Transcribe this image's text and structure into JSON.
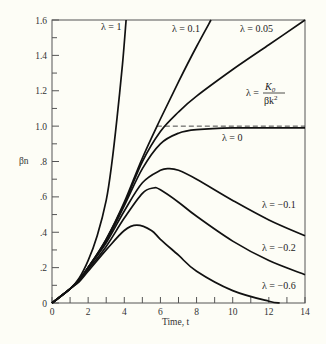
{
  "chart_data": {
    "type": "line",
    "title": "",
    "xlabel": "Time, t",
    "ylabel": "βn",
    "xlim": [
      0,
      14
    ],
    "ylim": [
      0,
      1.6
    ],
    "grid": false,
    "x_ticks": [
      "0",
      "2",
      "4",
      "6",
      "8",
      "10",
      "12",
      "14"
    ],
    "y_ticks": [
      "0",
      ".2",
      ".4",
      ".6",
      ".8",
      "1.0",
      "1.2",
      "1.4",
      "1.6"
    ],
    "reference_line": {
      "y": 1.0,
      "style": "dashed",
      "label": "λ = K₀/βk²"
    },
    "series": [
      {
        "name": "λ = 1",
        "label": "λ = 1",
        "points": [
          [
            0,
            0
          ],
          [
            1,
            0.08
          ],
          [
            1.5,
            0.14
          ],
          [
            2,
            0.24
          ],
          [
            2.5,
            0.38
          ],
          [
            3,
            0.58
          ],
          [
            3.3,
            0.78
          ],
          [
            3.6,
            1.05
          ],
          [
            3.9,
            1.35
          ],
          [
            4.1,
            1.6
          ]
        ]
      },
      {
        "name": "λ = 0.1",
        "label": "λ = 0.1",
        "points": [
          [
            0,
            0
          ],
          [
            1,
            0.08
          ],
          [
            1.5,
            0.13
          ],
          [
            2,
            0.2
          ],
          [
            3,
            0.36
          ],
          [
            4,
            0.57
          ],
          [
            5,
            0.82
          ],
          [
            6,
            1.04
          ],
          [
            7,
            1.25
          ],
          [
            8,
            1.45
          ],
          [
            8.8,
            1.6
          ]
        ]
      },
      {
        "name": "λ = 0.05",
        "label": "λ = 0.05",
        "points": [
          [
            0,
            0
          ],
          [
            1,
            0.08
          ],
          [
            1.5,
            0.13
          ],
          [
            2,
            0.2
          ],
          [
            3,
            0.36
          ],
          [
            4,
            0.56
          ],
          [
            5,
            0.8
          ],
          [
            6,
            0.97
          ],
          [
            7,
            1.08
          ],
          [
            8,
            1.17
          ],
          [
            10,
            1.32
          ],
          [
            12,
            1.46
          ],
          [
            14,
            1.6
          ]
        ]
      },
      {
        "name": "λ = 0",
        "label": "λ = 0",
        "points": [
          [
            0,
            0
          ],
          [
            1,
            0.08
          ],
          [
            1.5,
            0.13
          ],
          [
            2,
            0.2
          ],
          [
            3,
            0.35
          ],
          [
            4,
            0.55
          ],
          [
            5,
            0.76
          ],
          [
            6,
            0.9
          ],
          [
            7,
            0.96
          ],
          [
            8,
            0.98
          ],
          [
            10,
            0.99
          ],
          [
            14,
            0.99
          ]
        ]
      },
      {
        "name": "λ = -0.1",
        "label": "λ = −0.1",
        "points": [
          [
            0,
            0
          ],
          [
            1,
            0.08
          ],
          [
            1.5,
            0.13
          ],
          [
            2,
            0.2
          ],
          [
            3,
            0.34
          ],
          [
            4,
            0.52
          ],
          [
            5,
            0.68
          ],
          [
            6,
            0.75
          ],
          [
            6.5,
            0.76
          ],
          [
            7,
            0.75
          ],
          [
            8,
            0.7
          ],
          [
            10,
            0.58
          ],
          [
            12,
            0.47
          ],
          [
            14,
            0.38
          ]
        ]
      },
      {
        "name": "λ = -0.2",
        "label": "λ = −0.2",
        "points": [
          [
            0,
            0
          ],
          [
            1,
            0.08
          ],
          [
            1.5,
            0.13
          ],
          [
            2,
            0.19
          ],
          [
            3,
            0.32
          ],
          [
            4,
            0.48
          ],
          [
            5,
            0.62
          ],
          [
            5.6,
            0.65
          ],
          [
            6,
            0.64
          ],
          [
            7,
            0.57
          ],
          [
            8,
            0.49
          ],
          [
            10,
            0.35
          ],
          [
            12,
            0.24
          ],
          [
            14,
            0.16
          ]
        ]
      },
      {
        "name": "λ = -0.6",
        "label": "λ = −0.6",
        "points": [
          [
            0,
            0
          ],
          [
            1,
            0.08
          ],
          [
            1.5,
            0.12
          ],
          [
            2,
            0.18
          ],
          [
            3,
            0.3
          ],
          [
            4,
            0.41
          ],
          [
            4.7,
            0.44
          ],
          [
            5.5,
            0.41
          ],
          [
            6,
            0.36
          ],
          [
            7,
            0.27
          ],
          [
            8,
            0.18
          ],
          [
            10,
            0.07
          ],
          [
            12,
            0.01
          ],
          [
            12.6,
            0
          ]
        ]
      }
    ]
  },
  "labels": {
    "xlabel": "Time, t",
    "ylabel": "βn",
    "lam1": "λ = 1",
    "lam01": "λ = 0.1",
    "lam005": "λ = 0.05",
    "lamK_prefix": "λ =",
    "lamK_num": "K",
    "lamK_sub": "0",
    "lamK_den": "βk",
    "lamK_sup": "2",
    "lam0": "λ = 0",
    "lamm01": "λ = −0.1",
    "lamm02": "λ = −0.2",
    "lamm06": "λ = −0.6"
  }
}
